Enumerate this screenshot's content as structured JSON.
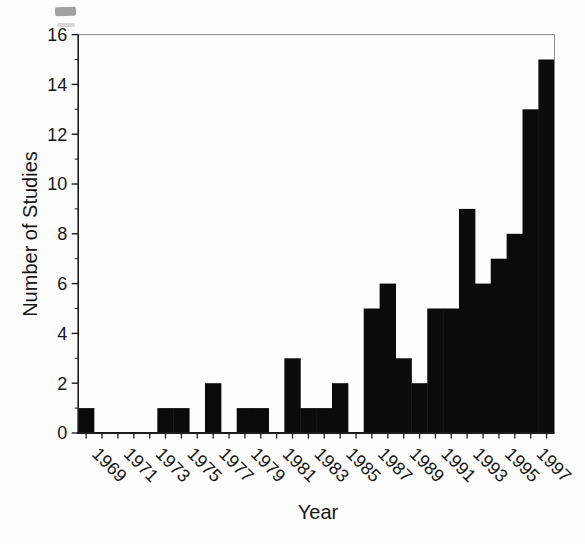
{
  "figure": {
    "background": "#fdfdfd",
    "bar_color": "#0b0b0b",
    "axis_color": "#1c1c1c",
    "frame_color": "#8a8a8a",
    "text_color": "#161616",
    "smudge_dark": "#555555",
    "smudge_light": "#9a9a9a"
  },
  "chart_data": {
    "type": "bar",
    "title": "",
    "xlabel": "Year",
    "ylabel": "Number of Studies",
    "categories": [
      1968,
      1969,
      1970,
      1971,
      1972,
      1973,
      1974,
      1975,
      1976,
      1977,
      1978,
      1979,
      1980,
      1981,
      1982,
      1983,
      1984,
      1985,
      1986,
      1987,
      1988,
      1989,
      1990,
      1991,
      1992,
      1993,
      1994,
      1995,
      1996,
      1997
    ],
    "values": [
      1,
      0,
      0,
      0,
      0,
      1,
      1,
      0,
      2,
      0,
      1,
      1,
      0,
      3,
      1,
      1,
      2,
      0,
      5,
      6,
      3,
      2,
      5,
      5,
      9,
      6,
      7,
      8,
      13,
      15
    ],
    "ylim": [
      0,
      16
    ],
    "yticks_major": [
      0,
      2,
      4,
      6,
      8,
      10,
      12,
      14,
      16
    ],
    "yticks_minor": [
      1,
      3,
      5,
      7,
      9,
      11,
      13,
      15
    ],
    "xtick_years": [
      1968,
      1969,
      1970,
      1971,
      1972,
      1973,
      1974,
      1975,
      1976,
      1977,
      1978,
      1979,
      1980,
      1981,
      1982,
      1983,
      1984,
      1985,
      1986,
      1987,
      1988,
      1989,
      1990,
      1991,
      1992,
      1993,
      1994,
      1995,
      1996,
      1997
    ],
    "xtick_labels": [
      "1969",
      "1971",
      "1973",
      "1975",
      "1977",
      "1979",
      "1981",
      "1983",
      "1985",
      "1987",
      "1989",
      "1991",
      "1993",
      "1995",
      "1997"
    ],
    "x_label_rotation_deg": 45,
    "bar_gap": 0,
    "grid": false,
    "legend": "none",
    "orientation": "vertical"
  }
}
